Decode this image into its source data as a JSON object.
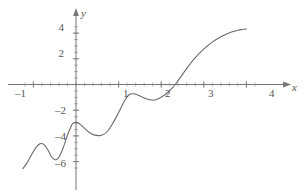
{
  "figure": {
    "width": 305,
    "height": 194,
    "background": "#ffffff"
  },
  "chart_data": {
    "type": "line",
    "title": "",
    "subtitle": "",
    "xlabel": "x",
    "ylabel": "y",
    "grid": false,
    "legend": null,
    "legend_position": "none",
    "axis_style": "cartesian-arrows",
    "curve_color": "#6b6b6b",
    "axis_color": "#777777",
    "xlim": [
      -1.3,
      4.25
    ],
    "ylim": [
      -6.6,
      4.6
    ],
    "xticks": [
      -1,
      1,
      2,
      3,
      4
    ],
    "xtick_labels": [
      "–1",
      "1",
      "2",
      "3",
      "4"
    ],
    "yticks": [
      4,
      2,
      -2,
      -4,
      -6
    ],
    "ytick_labels": [
      "4",
      "2",
      "–2",
      "–4",
      "–6"
    ],
    "minor_tick_interval_x": 0.2,
    "minor_tick_interval_y": 0.5,
    "series": [
      {
        "name": "curve",
        "x": [
          -1.25,
          -1.15,
          -1.05,
          -0.95,
          -0.85,
          -0.75,
          -0.65,
          -0.58,
          -0.5,
          -0.42,
          -0.32,
          -0.2,
          -0.1,
          -0.05,
          0.0,
          0.08,
          0.18,
          0.3,
          0.42,
          0.55,
          0.65,
          0.75,
          0.85,
          0.95,
          1.05,
          1.15,
          1.25,
          1.35,
          1.45,
          1.55,
          1.68,
          1.8,
          1.85,
          1.95,
          2.05,
          2.15,
          2.25,
          2.33,
          2.45,
          2.6,
          2.75,
          2.9,
          3.05,
          3.2,
          3.35,
          3.5,
          3.65,
          3.8,
          3.9,
          4.0
        ],
        "y": [
          -6.55,
          -6.1,
          -5.5,
          -4.95,
          -4.62,
          -4.68,
          -5.15,
          -5.6,
          -5.85,
          -5.75,
          -5.1,
          -3.95,
          -3.15,
          -2.98,
          -2.95,
          -3.05,
          -3.35,
          -3.7,
          -3.92,
          -3.98,
          -3.88,
          -3.6,
          -3.1,
          -2.5,
          -1.85,
          -1.2,
          -0.78,
          -0.72,
          -0.82,
          -0.98,
          -1.15,
          -1.22,
          -1.2,
          -1.08,
          -0.88,
          -0.62,
          -0.3,
          0.0,
          0.55,
          1.25,
          1.9,
          2.45,
          2.9,
          3.3,
          3.62,
          3.88,
          4.08,
          4.22,
          4.28,
          4.32
        ]
      }
    ],
    "key_points": {
      "local_max_1": [
        -0.85,
        -4.6
      ],
      "local_min_1": [
        -0.5,
        -5.85
      ],
      "local_max_2": [
        -0.05,
        -2.95
      ],
      "local_min_2": [
        0.55,
        -3.98
      ],
      "local_max_3": [
        1.3,
        -0.72
      ],
      "local_min_3": [
        1.82,
        -1.22
      ],
      "x_intercept": [
        2.33,
        0
      ],
      "right_end": [
        4.0,
        4.32
      ],
      "left_end": [
        -1.25,
        -6.55
      ]
    }
  },
  "labels": {
    "x_axis_name": "x",
    "y_axis_name": "y"
  }
}
